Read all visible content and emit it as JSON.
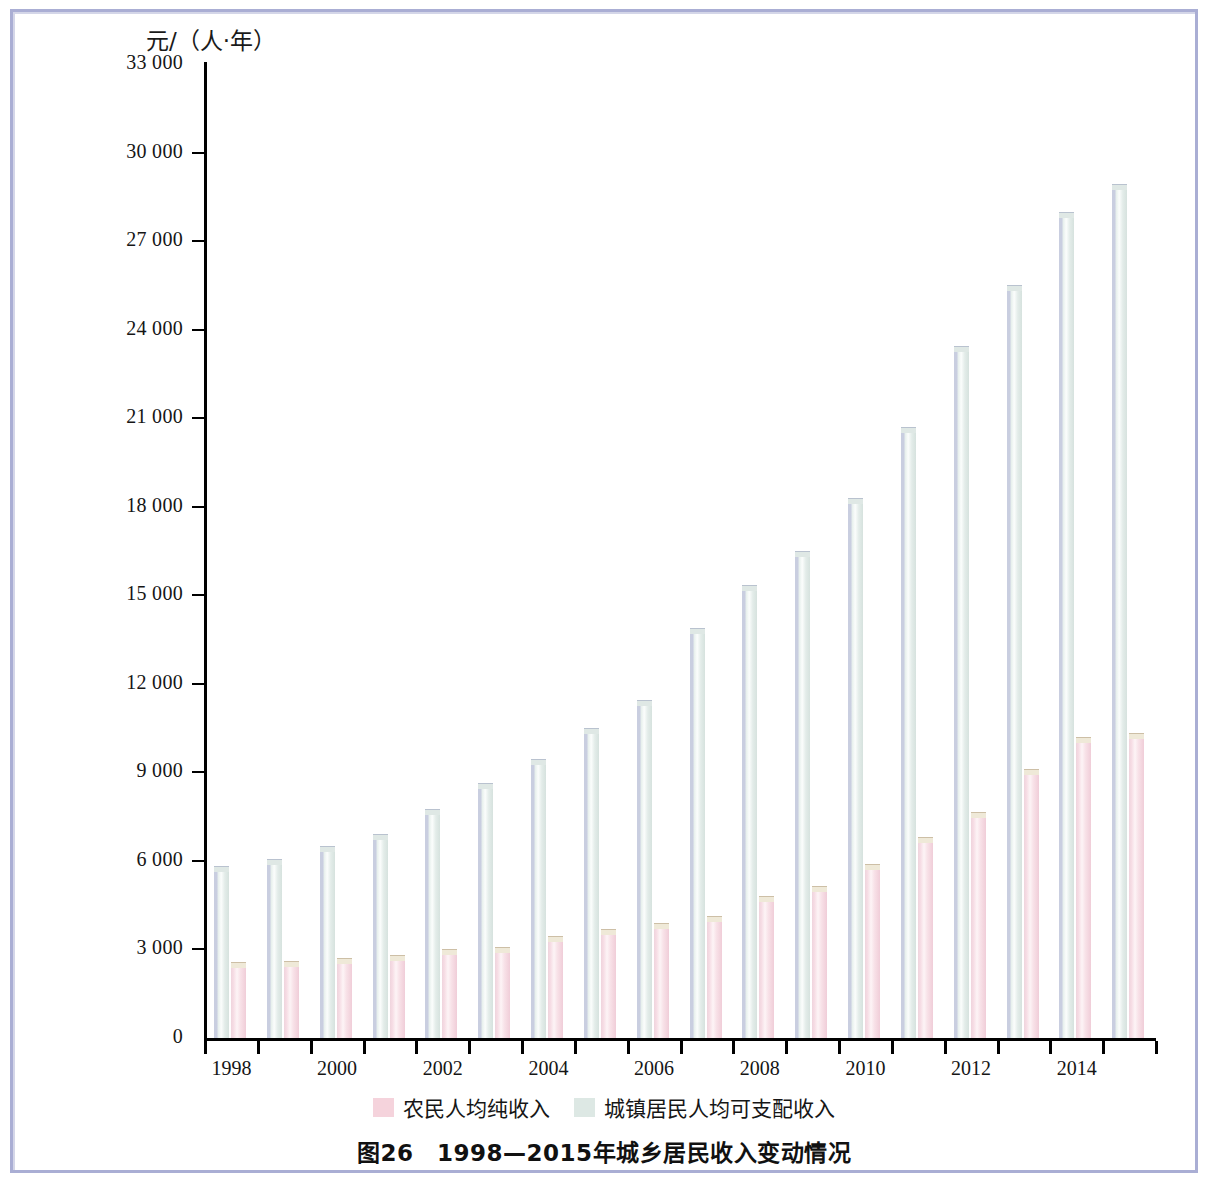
{
  "figure": {
    "caption": "图26　1998—2015年城乡居民收入变动情况",
    "y_axis_title": "元/（人·年）"
  },
  "legend": {
    "items": [
      {
        "label": "农民人均纯收入",
        "color": "#f5d3dc",
        "key": "rural"
      },
      {
        "label": "城镇居民人均可支配收入",
        "color": "#dde8e4",
        "key": "urban"
      }
    ]
  },
  "chart_data": {
    "type": "bar",
    "title": "图26　1998—2015年城乡居民收入变动情况",
    "xlabel": "",
    "ylabel": "元/（人·年）",
    "ylim": [
      0,
      33000
    ],
    "ytick_step": 3000,
    "ytick_labels": [
      "0",
      "3 000",
      "6 000",
      "9 000",
      "12 000",
      "15 000",
      "18 000",
      "21 000",
      "24 000",
      "27 000",
      "30 000",
      "33 000"
    ],
    "ytick_values": [
      0,
      3000,
      6000,
      9000,
      12000,
      15000,
      18000,
      21000,
      24000,
      27000,
      30000,
      33000
    ],
    "grid": false,
    "legend_position": "bottom",
    "categories": [
      1998,
      1999,
      2000,
      2001,
      2002,
      2003,
      2004,
      2005,
      2006,
      2007,
      2008,
      2009,
      2010,
      2011,
      2012,
      2013,
      2014,
      2015
    ],
    "xtick_labels_shown": [
      "1998",
      "2000",
      "2002",
      "2004",
      "2006",
      "2008",
      "2010",
      "2012",
      "2014"
    ],
    "series": [
      {
        "name": "城镇居民人均可支配收入",
        "color": "#dde8e4",
        "values": [
          5820,
          6070,
          6500,
          6900,
          7750,
          8650,
          9450,
          10500,
          11450,
          13900,
          15350,
          16500,
          18300,
          20700,
          23450,
          25500,
          28000,
          28950
        ]
      },
      {
        "name": "农民人均纯收入",
        "color": "#f5d3dc",
        "values": [
          2560,
          2620,
          2700,
          2800,
          3000,
          3100,
          3450,
          3700,
          3900,
          4150,
          4800,
          5150,
          5900,
          6800,
          7650,
          9100,
          10200,
          10350
        ]
      }
    ]
  }
}
